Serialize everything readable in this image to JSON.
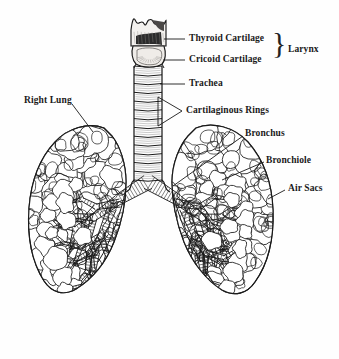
{
  "figure": {
    "background_color": "#fefefe",
    "ink_color": "#1a1a1a",
    "width": 339,
    "height": 359
  },
  "labels": [
    {
      "id": "thyroid-cartilage",
      "text": "Thyroid Cartilage",
      "x": 189,
      "y": 33,
      "leader": "line",
      "leader_from": [
        185,
        39
      ],
      "leader_to": [
        164,
        39
      ]
    },
    {
      "id": "cricoid-cartilage",
      "text": "Cricoid Cartilage",
      "x": 189,
      "y": 54,
      "leader": "line",
      "leader_from": [
        185,
        60
      ],
      "leader_to": [
        163,
        60
      ]
    },
    {
      "id": "larynx",
      "text": "Larynx",
      "x": 288,
      "y": 44,
      "leader": "brace",
      "brace_x": 272,
      "brace_y": 28
    },
    {
      "id": "trachea",
      "text": "Trachea",
      "x": 189,
      "y": 78,
      "leader": "line",
      "leader_from": [
        185,
        84
      ],
      "leader_to": [
        160,
        84
      ]
    },
    {
      "id": "cartilaginous-rings",
      "text": "Cartilaginous Rings",
      "x": 186,
      "y": 105,
      "leader": "wedge",
      "wedge_tip": [
        182,
        111
      ],
      "wedge_top": [
        158,
        97
      ],
      "wedge_bottom": [
        158,
        126
      ]
    },
    {
      "id": "bronchus",
      "text": "Bronchus",
      "x": 245,
      "y": 128,
      "leader": "line",
      "leader_from": [
        243,
        136
      ],
      "leader_to": [
        173,
        186
      ]
    },
    {
      "id": "bronchiole",
      "text": "Bronchiole",
      "x": 266,
      "y": 155,
      "leader": "line",
      "leader_from": [
        264,
        162
      ],
      "leader_to": [
        222,
        180
      ]
    },
    {
      "id": "air-sacs",
      "text": "Air Sacs",
      "x": 288,
      "y": 183,
      "leader": "line",
      "leader_from": [
        285,
        190
      ],
      "leader_to": [
        268,
        199
      ]
    },
    {
      "id": "right-lung",
      "text": "Right Lung",
      "x": 24,
      "y": 95,
      "leader": "line",
      "leader_from": [
        72,
        104
      ],
      "leader_to": [
        93,
        132
      ]
    }
  ],
  "anatomy": {
    "larynx": {
      "name": "larynx",
      "thyroid_cartilage": {
        "top": 18,
        "bottom": 47,
        "left": 130,
        "right": 166,
        "notch_count": 4,
        "description": "crown-shaped superior cartilage with notched rim"
      },
      "cricoid_cartilage": {
        "top": 47,
        "bottom": 66,
        "left": 132,
        "right": 164,
        "description": "ring-shaped cartilage below thyroid"
      }
    },
    "trachea": {
      "name": "trachea",
      "top": 66,
      "bottom": 186,
      "center_x": 148,
      "half_width": 14,
      "ring_count": 13,
      "description": "vertical ribbed tube of stacked cartilaginous rings"
    },
    "bronchi": {
      "name": "bronchi",
      "bifurcation": [
        148,
        186
      ],
      "left_main_end": [
        106,
        205
      ],
      "right_main_end": [
        190,
        205
      ],
      "description": "primary bronchi branch laterally then subdivide into bronchioles"
    },
    "lungs": [
      {
        "side": "right",
        "label_side": "viewer-left",
        "apex": [
          104,
          126
        ],
        "base": 290,
        "lateral_x": 30,
        "medial_x": 140,
        "lobes": 3
      },
      {
        "side": "left",
        "label_side": "viewer-right",
        "apex": [
          196,
          126
        ],
        "base": 290,
        "lateral_x": 272,
        "medial_x": 158,
        "lobes": 2
      }
    ],
    "air_sacs": {
      "name": "alveolar clusters",
      "description": "cauliflower-like lobulated clusters filling lung parenchyma"
    }
  }
}
